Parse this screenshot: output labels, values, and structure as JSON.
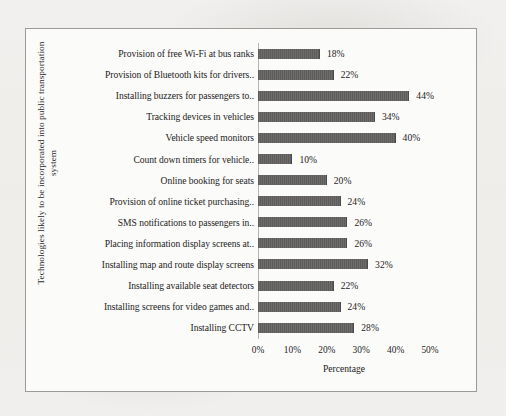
{
  "chart_data": {
    "type": "bar",
    "orientation": "horizontal",
    "title": "",
    "xlabel": "Percentage",
    "ylabel": "Technologies likely to be incorporated into public transportation system",
    "xlim": [
      0,
      50
    ],
    "xticks": [
      "0%",
      "10%",
      "20%",
      "30%",
      "40%",
      "50%"
    ],
    "xtick_values": [
      0,
      10,
      20,
      30,
      40,
      50
    ],
    "grid": false,
    "legend": false,
    "bar_color": "#646362",
    "categories": [
      "Provision of free Wi-Fi at bus ranks",
      "Provision of Bluetooth kits for drivers..",
      "Installing buzzers for passengers to..",
      "Tracking devices in vehicles",
      "Vehicle speed monitors",
      "Count down timers for vehicle..",
      "Online booking for seats",
      "Provision of online ticket purchasing..",
      "SMS notifications to passengers in..",
      "Placing information display screens at..",
      "Installing map and route display screens",
      "Installing available seat detectors",
      "Installing screens for video games and..",
      "Installing CCTV"
    ],
    "values": [
      18,
      22,
      44,
      34,
      40,
      10,
      20,
      24,
      26,
      26,
      32,
      22,
      24,
      28
    ],
    "value_labels": [
      "18%",
      "22%",
      "44%",
      "34%",
      "40%",
      "10%",
      "20%",
      "24%",
      "26%",
      "26%",
      "32%",
      "22%",
      "24%",
      "28%"
    ]
  }
}
